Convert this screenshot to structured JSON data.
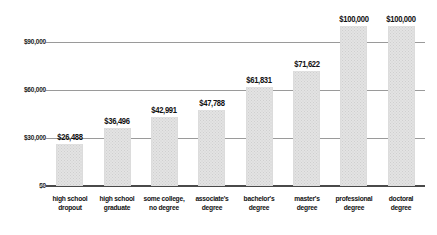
{
  "chart_data": {
    "type": "bar",
    "title": "",
    "subtitle": "",
    "xlabel": "",
    "ylabel": "",
    "categories": [
      "high school dropout",
      "high school graduate",
      "some college, no degree",
      "associate's degree",
      "bachelor's degree",
      "master's degree",
      "professional degree",
      "doctoral degree"
    ],
    "category_lines": [
      [
        "high school",
        "dropout"
      ],
      [
        "high school",
        "graduate"
      ],
      [
        "some college,",
        "no degree"
      ],
      [
        "associate's",
        "degree"
      ],
      [
        "bachelor's",
        "degree"
      ],
      [
        "master's",
        "degree"
      ],
      [
        "professional",
        "degree"
      ],
      [
        "doctoral",
        "degree"
      ]
    ],
    "values": [
      26488,
      36496,
      42991,
      47788,
      61831,
      71622,
      100000,
      100000
    ],
    "value_labels": [
      "$26,488",
      "$36,496",
      "$42,991",
      "$47,788",
      "$61,831",
      "$71,622",
      "$100,000",
      "$100,000"
    ],
    "ylim": [
      0,
      100000
    ],
    "yticks": [
      0,
      30000,
      60000,
      90000
    ],
    "ytick_labels": [
      "$0",
      "$30,000",
      "$60,000",
      "$90,000"
    ],
    "grid": true,
    "legend": false,
    "bar_color": "#e3e3e3",
    "grid_color": "#9a9a9a",
    "axis_color": "#4a4a4a",
    "text_color": "#111111"
  }
}
